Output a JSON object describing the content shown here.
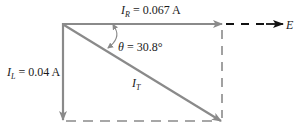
{
  "diagram": {
    "type": "phasor-diagram",
    "colors": {
      "vector": "#8a8a8a",
      "reference_arrow": "#111111",
      "text": "#1a1a1a",
      "background": "#ffffff"
    },
    "vectors": {
      "ir": {
        "symbol": "I",
        "subscript": "R",
        "equals": " = ",
        "value": "0.067 A",
        "direction": "right"
      },
      "il": {
        "symbol": "I",
        "subscript": "L",
        "equals": " = ",
        "value": "0.04 A",
        "direction": "down"
      },
      "it": {
        "symbol": "I",
        "subscript": "T",
        "direction": "diagonal-down-right"
      }
    },
    "angle": {
      "symbol": "θ",
      "equals": " = ",
      "value": "30.8°"
    },
    "reference": {
      "label": "E"
    }
  }
}
